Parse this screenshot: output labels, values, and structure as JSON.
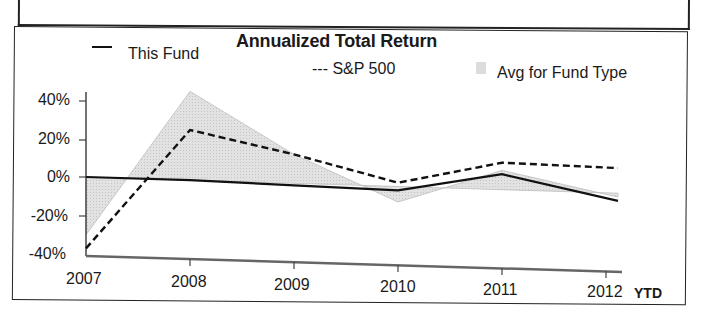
{
  "chart_data": {
    "type": "line",
    "title": "Annualized Total Return",
    "xlabel": "",
    "ylabel": "",
    "categories": [
      "2007",
      "2008",
      "2009",
      "2010",
      "2011",
      "2012"
    ],
    "x_suffix_label": "YTD",
    "y_ticks": [
      "40%",
      "20%",
      "0%",
      "-20%",
      "-40%"
    ],
    "ylim": [
      -40,
      45
    ],
    "grid": false,
    "legend_position": "top",
    "series": [
      {
        "name": "This Fund",
        "style": "solid",
        "values": [
          0,
          0,
          -1,
          -2,
          8,
          -4
        ]
      },
      {
        "name": "S&P 500",
        "style": "dashed",
        "values": [
          -37,
          26,
          15,
          2,
          14,
          13
        ]
      },
      {
        "name": "Avg for Fund Type",
        "style": "area",
        "values": [
          -30,
          46,
          15,
          -8,
          10,
          -2
        ]
      }
    ]
  },
  "legend": {
    "this_fund": "This Fund",
    "sp500": "--- S&P 500",
    "avg_fund_type": "Avg for Fund Type"
  },
  "colors": {
    "this_fund": "#111111",
    "sp500": "#111111",
    "avg_fill": "#d9d9d9",
    "avg_edge": "#bdbdbd"
  }
}
